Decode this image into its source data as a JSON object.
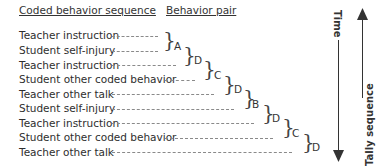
{
  "headers": {
    "sequence": "Coded behavior sequence",
    "pair": "Behavior pair"
  },
  "sequence": [
    "Teacher instruction",
    "Student self-injury",
    "Teacher instruction",
    "Student other coded behavior",
    "Teacher other talk",
    "Student self-injury",
    "Teacher instruction",
    "Student other coded behavior",
    "Teacher other talk"
  ],
  "pairs": [
    "A",
    "D",
    "C",
    "D",
    "B",
    "D",
    "C",
    "D"
  ],
  "axes": {
    "time": "Time",
    "tally": "Tally sequence"
  }
}
